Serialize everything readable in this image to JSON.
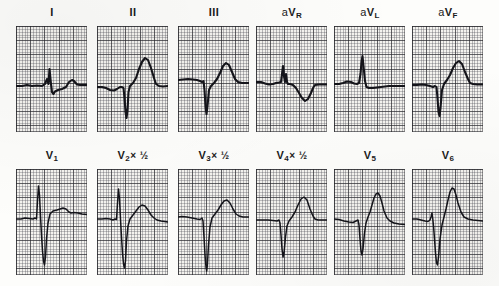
{
  "figure": {
    "kind": "12-lead-electrocardiogram",
    "rows": 2,
    "panels_per_row": 6,
    "paper_color": "#f4f3ef",
    "grid_fine_color": "#46465060",
    "grid_bold_color": "#282a2d9e",
    "trace_color": "#14141a"
  },
  "rows": [
    {
      "name": "limb-and-augmented-leads",
      "panels": [
        {
          "id": "lead-I",
          "label_html": "I",
          "label_text": "I",
          "scale_note": "",
          "trace": "M0,60 L6,60 L11,59 L16,60 L21,59.5 L26,60 L29,58 L31,53 L32.5,58 L33.5,43 L35,58 L36,66 L37.5,68 L39,65.5 L42,64 L46,63 L50,61 L53,56 L56,54 L58,55 L61,58.5 L64,59 L71,59"
        },
        {
          "id": "lead-II",
          "label_html": "II",
          "label_text": "II",
          "scale_note": "",
          "trace": "M0,61 L5,61 L9,62 L13,64 L17,64.5 L20,63 L23,61 L25,61 L26.5,62 L27.5,72 L28.5,86 L29.5,92 L30.5,84 L31.5,66 L33,60 L36,57 L39,52 L42,43 L45,36 L48,32 L51,34 L54,42 L57,52 L59,58 L62,60 L66,60.5 L71,60"
        },
        {
          "id": "lead-III",
          "label_html": "III",
          "label_text": "III",
          "scale_note": "",
          "trace": "M0,54 L5,53.5 L10,53 L15,53.5 L19,54 L22,55 L24,56 L25.5,55 L26.5,64 L27.5,80 L28.5,88 L29.5,80 L31,64 L33,60 L36,57 L39,53 L42,47 L45,40 L48,37 L51,39 L54,46 L57,53 L60,56 L64,57 L71,57"
        },
        {
          "id": "lead-aVR",
          "label_html": "aV<sub>R</sub>",
          "label_text": "aVR",
          "scale_note": "",
          "trace": "M0,56 L5,56 L9,57.5 L13,58.5 L17,58 L20,57 L23,56.5 L25,56 L26,48 L27,40 L28,50 L29,56 L30,48 L31,56 L32,58 L34,58 L37,59 L40,62 L43,67 L46,72 L49,75 L52,73 L55,67 L57,62 L59,59 L63,58.5 L71,58.5"
        },
        {
          "id": "lead-aVL",
          "label_html": "aV<sub>L</sub>",
          "label_text": "aVL",
          "scale_note": "",
          "trace": "M0,58 L5,58 L9,57 L13,55.5 L17,56 L20,57.5 L23,58 L25,57 L26.5,48 L27.5,36 L28.5,30 L29.5,40 L31,55 L32.5,61 L35,62 L39,62 L43,61.5 L47,61 L51,60.5 L55,60 L60,60 L65,60 L71,60"
        },
        {
          "id": "lead-aVF",
          "label_html": "aV<sub>F</sub>",
          "label_text": "aVF",
          "scale_note": "",
          "trace": "M0,59 L5,59 L10,58.5 L14,59 L18,60 L21,61 L23,60 L24.5,61 L25.5,72 L26.5,86 L27.5,90 L28.5,82 L30,64 L32,58 L35,54 L38,49 L41,42 L44,37 L47,35 L50,38 L53,46 L56,53 L58,57 L61,58 L65,58.5 L71,58.5"
        }
      ]
    },
    {
      "name": "precordial-leads",
      "panels": [
        {
          "id": "lead-V1",
          "label_html": "V<sub>1</sub>",
          "label_text": "V1",
          "scale_note": "",
          "trace": "M0,50 L5,50 L9,49 L13,49.5 L17,50 L19,49 L20.5,50 L21.5,32 L22.5,17 L23.5,26 L24.5,47 L25.5,66 L26.5,82 L27.5,92 L28.5,96 L29.5,88 L30.5,70 L32,54 L34,45 L37,42 L41,41 L44,40 L47,39 L50,40 L53,43 L55,44 L58,43.5 L62,44 L66,45 L71,45.5"
        },
        {
          "id": "lead-V2",
          "label_html": "V<sub>2</sub> &#215; &#189;",
          "label_text": "V2 × ½",
          "scale_note": "× ½",
          "trace": "M0,50 L5,50 L9,49.5 L13,50 L16,51 L18,50 L19.5,50.5 L20.5,34 L21.5,20 L22.5,30 L23.5,50 L24.5,68 L25.5,84 L26.5,95 L27.5,99 L28.5,92 L29.5,72 L31,57 L33,50 L36,46 L39,42 L42,38 L45,36 L48,37 L51,41 L54,46 L57,49 L60,51 L64,52 L71,53"
        },
        {
          "id": "lead-V3",
          "label_html": "V<sub>3</sub> &#215; &#189;",
          "label_text": "V3 × ½",
          "scale_note": "× ½",
          "trace": "M0,48 L4,47.5 L9,48 L14,49 L19,50 L22,50.5 L24,49 L25,52 L26,68 L27,86 L28,98 L28.7,102 L29.4,96 L30.5,76 L32,58 L34,49 L37,45 L40,41 L43,36 L46,32 L49,31 L52,34 L55,40 L58,45 L61,47 L65,48 L71,48"
        },
        {
          "id": "lead-V4",
          "label_html": "V<sub>4</sub> &#215; &#189;",
          "label_text": "V4 × ½",
          "scale_note": "× ½",
          "trace": "M0,51 L6,51 L12,51 L17,51.5 L21,52 L23,51 L24,54 L25,66 L26,80 L27,88 L28,84 L29.5,68 L31,57 L33,52 L36,48 L39,43 L42,36 L45,30 L48,28 L51,31 L54,40 L57,47 L59,50 L62,51 L66,51 L71,51"
        },
        {
          "id": "lead-V5",
          "label_html": "V<sub>5</sub>",
          "label_text": "V5",
          "scale_note": "",
          "trace": "M0,50 L5,50.5 L10,52 L15,53 L19,53.5 L22,52 L24,51 L25,56 L26,70 L27,82 L28,86 L29,80 L30.5,64 L32,54 L34,48 L36,43 L38,36 L40,29 L42,25 L44,24 L46,27 L48,34 L50,42 L53,49 L56,52 L60,54 L65,55 L71,55.5"
        },
        {
          "id": "lead-V6",
          "label_html": "V<sub>6</sub>",
          "label_text": "V6",
          "scale_note": "",
          "trace": "M0,50 L5,50 L9,51 L13,52 L16,52.5 L18,51 L19,48 L20,44 L20.8,50 L21.6,58 L22.5,70 L23.5,84 L24.5,94 L25.5,96 L26.5,88 L28,70 L30,56 L32,48 L34,40 L36,31 L38,23 L40,19 L42,20 L44,26 L46,34 L49,43 L52,48 L56,50 L61,51 L66,51.5 L71,52"
        }
      ]
    }
  ]
}
